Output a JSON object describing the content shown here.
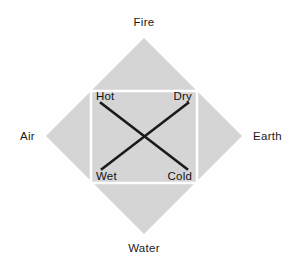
{
  "diagram": {
    "colors": {
      "background": "#ffffff",
      "diamond_fill": "#d5d5d5",
      "square_border": "#ffffff",
      "line_color": "#1a1a1a",
      "text_color": "#1a1a1a"
    },
    "geometry": {
      "diamond": {
        "top": [
          144,
          38
        ],
        "right": [
          242,
          136
        ],
        "bottom": [
          144,
          234
        ],
        "left": [
          46,
          136
        ]
      },
      "square": {
        "x": 91,
        "y": 91,
        "width": 106,
        "height": 92,
        "stroke_width": 2.5
      },
      "cross_center": [
        144,
        140
      ],
      "cross_stroke_width": 2.6,
      "diagonal_hot_cold": [
        [
          101,
          103
        ],
        [
          187,
          169
        ]
      ],
      "diagonal_dry_wet": [
        [
          188,
          103
        ],
        [
          102,
          169
        ]
      ]
    },
    "elements": [
      {
        "label": "Fire",
        "position": "top",
        "x": 144,
        "y": 26
      },
      {
        "label": "Earth",
        "position": "right",
        "x": 253,
        "y": 140
      },
      {
        "label": "Water",
        "position": "bottom",
        "x": 144,
        "y": 252
      },
      {
        "label": "Air",
        "position": "left",
        "x": 35,
        "y": 140
      }
    ],
    "qualities": [
      {
        "label": "Hot",
        "corner": "top-left",
        "x": 96,
        "y": 100
      },
      {
        "label": "Dry",
        "corner": "top-right",
        "x": 192,
        "y": 100
      },
      {
        "label": "Wet",
        "corner": "bottom-left",
        "x": 96,
        "y": 180
      },
      {
        "label": "Cold",
        "corner": "bottom-right",
        "x": 192,
        "y": 180
      }
    ]
  }
}
